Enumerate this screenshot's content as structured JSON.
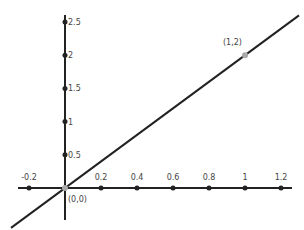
{
  "chart_data": {
    "type": "line",
    "title": "",
    "xlabel": "",
    "ylabel": "",
    "xlim": [
      -0.35,
      1.25
    ],
    "ylim": [
      -0.45,
      2.6
    ],
    "x_ticks": [
      -0.2,
      0.2,
      0.4,
      0.6,
      0.8,
      1,
      1.2
    ],
    "x_tick_labels": [
      "-0.2",
      "0.2",
      "0.4",
      "0.6",
      "0.8",
      "1",
      "1.2"
    ],
    "y_ticks": [
      0.5,
      1,
      1.5,
      2,
      2.5
    ],
    "y_tick_labels": [
      "0.5",
      "1",
      "1.5",
      "2",
      "2.5"
    ],
    "grid": false,
    "series": [
      {
        "name": "y = 2x",
        "x": [
          -0.3,
          1.3
        ],
        "y": [
          -0.6,
          2.6
        ]
      }
    ],
    "points": [
      {
        "x": 0,
        "y": 0,
        "label": "(0,0)"
      },
      {
        "x": 1,
        "y": 2,
        "label": "(1,2)"
      }
    ]
  },
  "colors": {
    "axis": "#222222",
    "line": "#222222",
    "point": "#aaaaaa"
  }
}
